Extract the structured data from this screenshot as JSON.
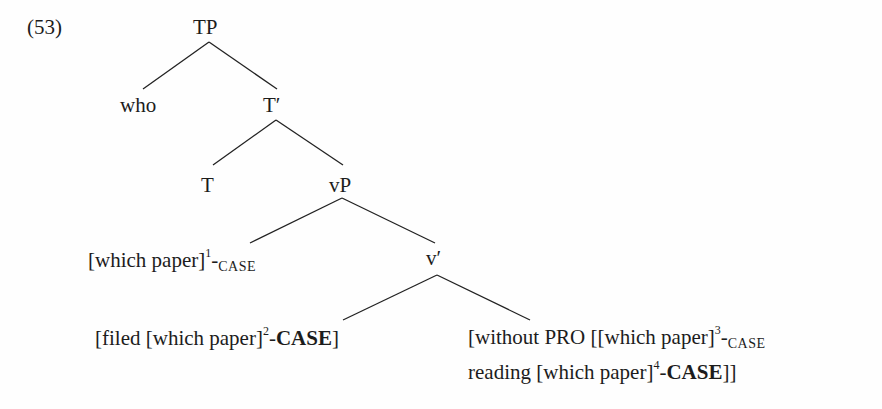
{
  "example_number": "(53)",
  "tree": {
    "root": {
      "label": "TP"
    },
    "spec_tp": {
      "label": "who"
    },
    "t_bar": {
      "label": "T′"
    },
    "t_head": {
      "label": "T"
    },
    "vp": {
      "label": "vP"
    },
    "spec_vp": {
      "text": "[which paper]",
      "index": "1",
      "dash": "-",
      "case": "CASE",
      "case_style": "small-caps"
    },
    "v_bar": {
      "label": "v′"
    },
    "v_complement": {
      "prefix": "[filed [which paper]",
      "index": "2",
      "dash": "-",
      "case": "CASE",
      "case_style": "bold",
      "suffix": "]"
    },
    "adjunct": {
      "line1_prefix": "[without PRO [[which paper]",
      "line1_index": "3",
      "line1_dash": "-",
      "line1_case": "CASE",
      "line1_case_style": "small-caps",
      "line2_prefix": "reading [which paper]",
      "line2_index": "4",
      "line2_dash": "-",
      "line2_case": "CASE",
      "line2_case_style": "bold",
      "line2_suffix": "]]"
    }
  },
  "edges": [
    {
      "from": "TP",
      "to": "who"
    },
    {
      "from": "TP",
      "to": "T′"
    },
    {
      "from": "T′",
      "to": "T"
    },
    {
      "from": "T′",
      "to": "vP"
    },
    {
      "from": "vP",
      "to": "[which paper]1-CASE"
    },
    {
      "from": "vP",
      "to": "v′"
    },
    {
      "from": "v′",
      "to": "[filed [which paper]2-CASE]"
    },
    {
      "from": "v′",
      "to": "[without PRO ...]"
    }
  ]
}
